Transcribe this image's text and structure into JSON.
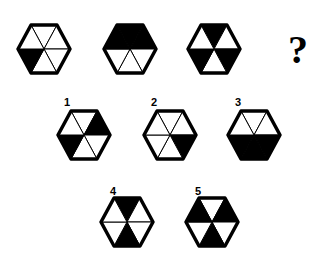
{
  "puzzle": {
    "sequence": [
      {
        "id": "seq-1",
        "filled": [
          "lower-left"
        ]
      },
      {
        "id": "seq-2",
        "filled": [
          "upper-left",
          "top",
          "upper-right"
        ]
      },
      {
        "id": "seq-3",
        "filled": [
          "top",
          "lower-left",
          "lower-right"
        ]
      }
    ],
    "question_mark": "?",
    "options": [
      {
        "label": "1",
        "filled": [
          "upper-right",
          "lower-left"
        ]
      },
      {
        "label": "2",
        "filled": [
          "lower-right"
        ]
      },
      {
        "label": "3",
        "filled": [
          "lower-left",
          "bottom",
          "lower-right"
        ]
      },
      {
        "label": "4",
        "filled": [
          "top",
          "bottom"
        ]
      },
      {
        "label": "5",
        "filled": [
          "upper-left",
          "upper-right",
          "bottom"
        ]
      }
    ],
    "colors": {
      "fill": "#000000",
      "empty": "#ffffff",
      "stroke": "#000000"
    }
  }
}
